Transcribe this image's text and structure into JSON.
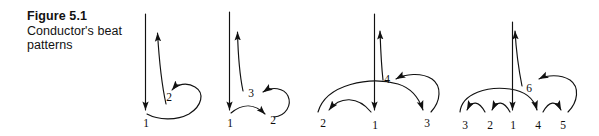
{
  "figure": {
    "caption_title": "Figure 5.1",
    "caption_subtitle": "Conductor's beat patterns",
    "background_color": "#ffffff",
    "ink_color": "#111111"
  },
  "diagrams": [
    {
      "name": "two-beat-pattern",
      "beats": 2,
      "labels": [
        {
          "text": "1",
          "x": 146,
          "y": 127
        },
        {
          "text": "2",
          "x": 169,
          "y": 101
        }
      ]
    },
    {
      "name": "three-beat-pattern",
      "beats": 3,
      "labels": [
        {
          "text": "1",
          "x": 230,
          "y": 127
        },
        {
          "text": "2",
          "x": 273,
          "y": 124
        },
        {
          "text": "3",
          "x": 251,
          "y": 97
        }
      ]
    },
    {
      "name": "four-beat-pattern",
      "beats": 4,
      "labels": [
        {
          "text": "2",
          "x": 323,
          "y": 127
        },
        {
          "text": "1",
          "x": 375,
          "y": 129
        },
        {
          "text": "3",
          "x": 427,
          "y": 127
        },
        {
          "text": "4",
          "x": 387,
          "y": 83
        }
      ]
    },
    {
      "name": "six-beat-pattern",
      "beats": 6,
      "labels": [
        {
          "text": "3",
          "x": 465,
          "y": 129
        },
        {
          "text": "2",
          "x": 490,
          "y": 129
        },
        {
          "text": "1",
          "x": 513,
          "y": 129
        },
        {
          "text": "4",
          "x": 538,
          "y": 129
        },
        {
          "text": "5",
          "x": 563,
          "y": 129
        }
      ]
    },
    {
      "name": "six-beat-upbeat-label",
      "labels": [
        {
          "text": "6",
          "x": 529,
          "y": 92
        }
      ]
    }
  ]
}
